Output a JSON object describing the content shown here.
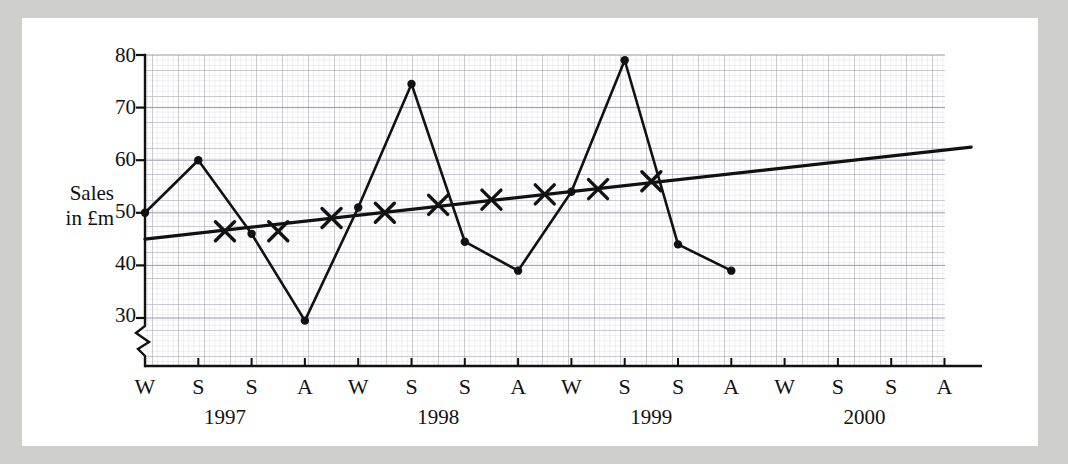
{
  "chart_data": {
    "type": "line",
    "title": "",
    "ylabel_line1": "Sales",
    "ylabel_line2": "in £m",
    "xlabel": "",
    "ylim": [
      30,
      80
    ],
    "y_ticks": [
      30,
      40,
      50,
      60,
      70,
      80
    ],
    "y_axis_break": true,
    "grid": true,
    "grid_minor": true,
    "legend_position": "none",
    "x_tick_labels": [
      "W",
      "S",
      "S",
      "A",
      "W",
      "S",
      "S",
      "A",
      "W",
      "S",
      "S",
      "A",
      "W",
      "S",
      "S",
      "A"
    ],
    "year_labels": [
      "1997",
      "1998",
      "1999",
      "2000"
    ],
    "x_categories": [
      "W 1997",
      "S 1997",
      "S 1997",
      "A 1997",
      "W 1998",
      "S 1998",
      "S 1998",
      "A 1998",
      "W 1999",
      "S 1999",
      "S 1999",
      "A 1999",
      "W 2000",
      "S 2000",
      "S 2000",
      "A 2000"
    ],
    "series": [
      {
        "name": "Sales",
        "marker": "dot",
        "x_index": [
          0,
          1,
          2,
          3,
          4,
          5,
          6,
          7,
          8,
          9,
          10,
          11
        ],
        "values": [
          50,
          60,
          46,
          29.5,
          51,
          74.5,
          44.5,
          39,
          54,
          79,
          44,
          39
        ]
      },
      {
        "name": "4-point moving average",
        "marker": "cross",
        "x_index": [
          1.5,
          2.5,
          3.5,
          4.5,
          5.5,
          6.5,
          7.5,
          8.5,
          9.5
        ],
        "values": [
          46.5,
          46.5,
          49,
          50,
          51.5,
          52.5,
          53.5,
          54.5,
          56
        ]
      },
      {
        "name": "Trend line",
        "marker": "none",
        "x_index": [
          0,
          15.5
        ],
        "values": [
          45,
          62.5
        ]
      }
    ]
  },
  "axis": {
    "y_tick_80": "80",
    "y_tick_70": "70",
    "y_tick_60": "60",
    "y_tick_50": "50",
    "y_tick_40": "40",
    "y_tick_30": "30"
  },
  "x_ticks": {
    "t0": "W",
    "t1": "S",
    "t2": "S",
    "t3": "A",
    "t4": "W",
    "t5": "S",
    "t6": "S",
    "t7": "A",
    "t8": "W",
    "t9": "S",
    "t10": "S",
    "t11": "A",
    "t12": "W",
    "t13": "S",
    "t14": "S",
    "t15": "A"
  },
  "years": {
    "y1": "1997",
    "y2": "1998",
    "y3": "1999",
    "y4": "2000"
  },
  "colors": {
    "ink": "#111111",
    "grid_minor": "#c9c9d2",
    "grid_major": "#9a9aa6",
    "paper": "#ffffff",
    "backdrop": "#cfcfcb"
  }
}
